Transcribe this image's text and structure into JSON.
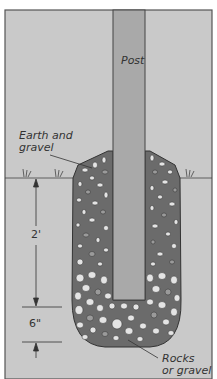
{
  "diagram": {
    "labels": {
      "post": "Post",
      "earth_gravel_line1": "Earth and",
      "earth_gravel_line2": "gravel",
      "rocks_line1": "Rocks",
      "rocks_line2": "or gravel"
    },
    "dimensions": {
      "upper_depth": "2'",
      "lower_depth": "6\""
    },
    "colors": {
      "background": "#c9c9c9",
      "border": "#555555",
      "post": "#a9a9a9",
      "fill": "#6b6b6b",
      "rock_light": "#e4e4e4",
      "rock_mid": "#9a9a9a",
      "line": "#333333"
    }
  }
}
